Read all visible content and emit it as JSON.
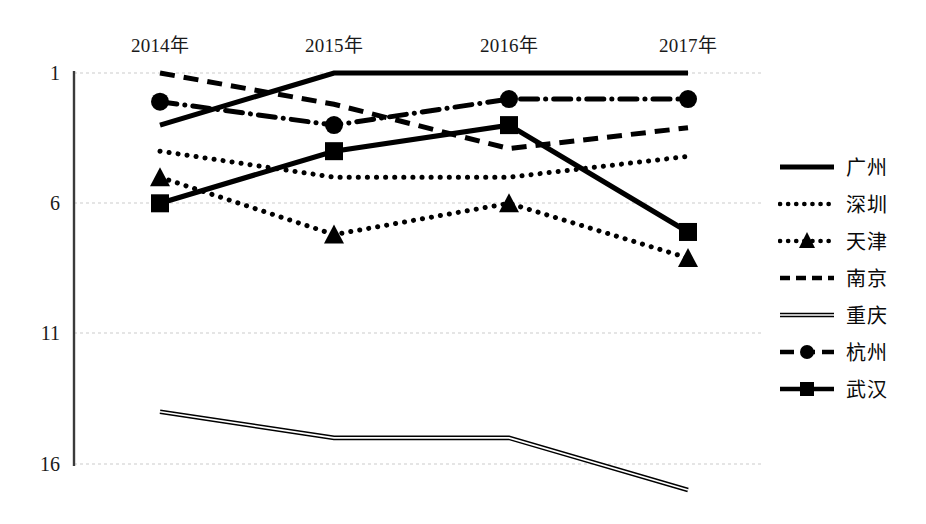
{
  "chart_data": {
    "type": "line",
    "title": "",
    "xlabel": "",
    "ylabel": "",
    "categories": [
      "2014年",
      "2015年",
      "2016年",
      "2017年"
    ],
    "x_tick_labels": [
      "2014年",
      "2015年",
      "2016年",
      "2017年"
    ],
    "y_tick_labels": [
      "1",
      "6",
      "11",
      "16"
    ],
    "y_ticks": [
      1,
      6,
      11,
      16
    ],
    "ylim": [
      1,
      17.6
    ],
    "y_axis_inverted": true,
    "grid": "horizontal",
    "legend_position": "right",
    "series": [
      {
        "name": "广州",
        "values": [
          3.0,
          1.0,
          1.0,
          1.0
        ],
        "style": "solid-thick",
        "marker": "none",
        "color": "#000000"
      },
      {
        "name": "深圳",
        "values": [
          4.0,
          5.0,
          5.0,
          4.2
        ],
        "style": "dotted",
        "marker": "none",
        "color": "#000000"
      },
      {
        "name": "天津",
        "values": [
          5.0,
          7.2,
          6.0,
          8.1
        ],
        "style": "dotted",
        "marker": "triangle",
        "color": "#000000"
      },
      {
        "name": "南京",
        "values": [
          1.0,
          2.2,
          3.9,
          3.1
        ],
        "style": "dashed",
        "marker": "none",
        "color": "#000000"
      },
      {
        "name": "重庆",
        "values": [
          14.0,
          15.0,
          15.0,
          17.0
        ],
        "style": "thin-double",
        "marker": "none",
        "color": "#000000"
      },
      {
        "name": "杭州",
        "values": [
          2.1,
          3.0,
          2.0,
          2.0
        ],
        "style": "dash-dot",
        "marker": "circle",
        "color": "#000000"
      },
      {
        "name": "武汉",
        "values": [
          6.0,
          4.0,
          3.0,
          7.1
        ],
        "style": "solid-thick",
        "marker": "square",
        "color": "#000000"
      }
    ]
  },
  "legend": {
    "items": [
      {
        "label": "广州"
      },
      {
        "label": "深圳"
      },
      {
        "label": "天津"
      },
      {
        "label": "南京"
      },
      {
        "label": "重庆"
      },
      {
        "label": "杭州"
      },
      {
        "label": "武汉"
      }
    ]
  },
  "axes": {
    "x_labels": [
      "2014年",
      "2015年",
      "2016年",
      "2017年"
    ],
    "y_labels": [
      "1",
      "6",
      "11",
      "16"
    ]
  },
  "colors": {
    "line": "#000000",
    "grid": "#cccccc",
    "axis": "#444444",
    "background": "#ffffff"
  }
}
